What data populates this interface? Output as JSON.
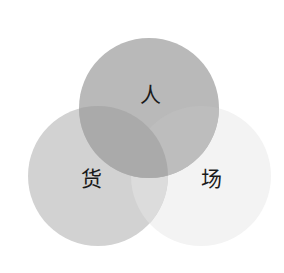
{
  "diagram": {
    "type": "venn",
    "circles": [
      {
        "id": "people",
        "label": "人",
        "cx": 149,
        "cy": 108,
        "r": 70,
        "fill": "#b9b9b9"
      },
      {
        "id": "goods",
        "label": "货",
        "cx": 98,
        "cy": 176,
        "r": 70,
        "fill": "#d2d2d2"
      },
      {
        "id": "place",
        "label": "场",
        "cx": 201,
        "cy": 176,
        "r": 70,
        "fill": "#f3f3f3"
      }
    ],
    "overlap_colors": {
      "people_goods": "#a9a9a9",
      "people_place": "#c4c4c4",
      "goods_place": "#dedede"
    }
  }
}
